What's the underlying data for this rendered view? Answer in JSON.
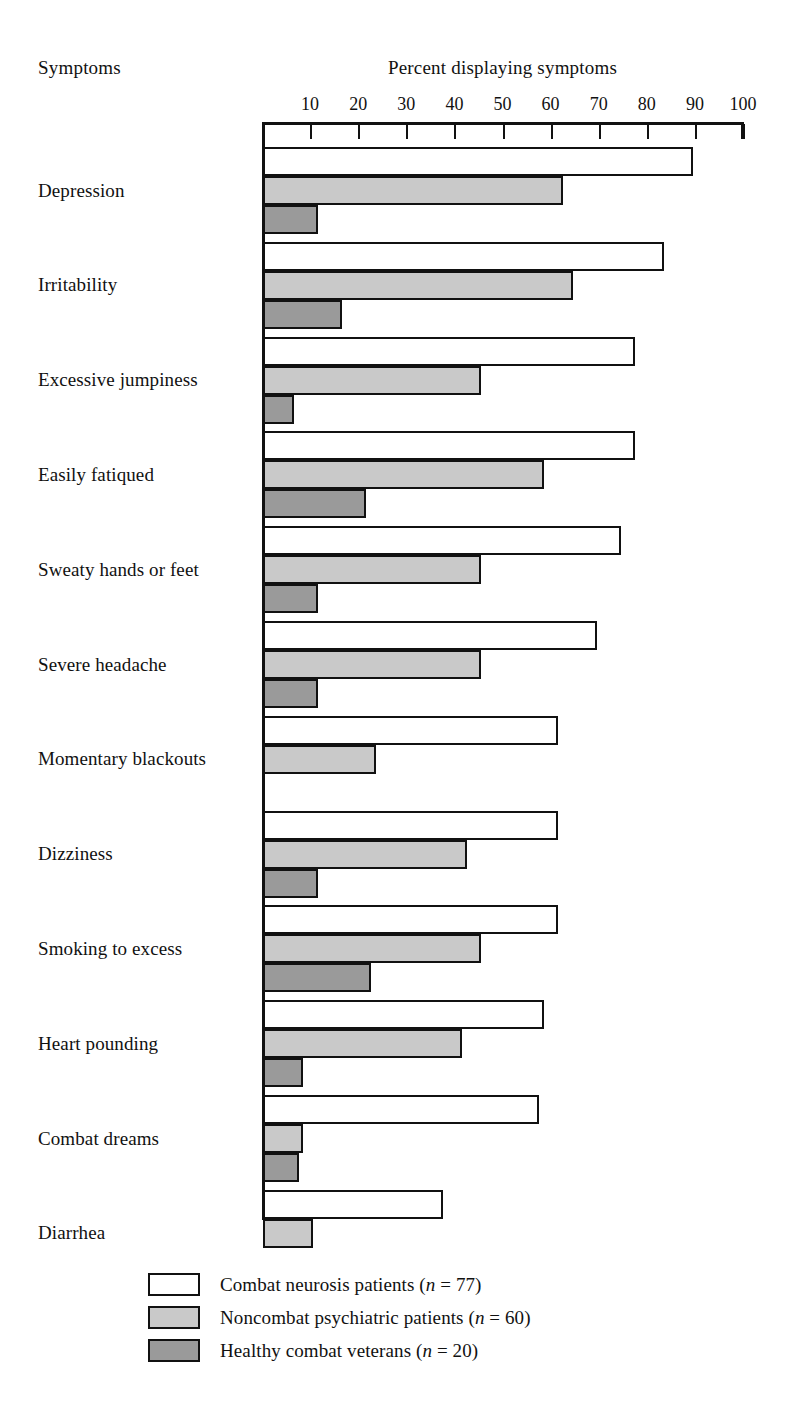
{
  "header": {
    "left_title": "Symptoms",
    "axis_title": "Percent displaying symptoms"
  },
  "chart_data": {
    "type": "bar",
    "orientation": "horizontal",
    "title": "Percent displaying symptoms",
    "xlabel": "Percent displaying symptoms",
    "ylabel": "Symptoms",
    "xlim": [
      0,
      100
    ],
    "xticks": [
      10,
      20,
      30,
      40,
      50,
      60,
      70,
      80,
      90,
      100
    ],
    "grid": false,
    "legend_position": "bottom",
    "categories": [
      "Depression",
      "Irritability",
      "Excessive jumpiness",
      "Easily fatiqued",
      "Sweaty hands or feet",
      "Severe headache",
      "Momentary blackouts",
      "Dizziness",
      "Smoking to excess",
      "Heart pounding",
      "Combat dreams",
      "Diarrhea"
    ],
    "series": [
      {
        "name": "Combat neurosis patients (n = 77)",
        "short_name": "Combat neurosis patients",
        "n": 77,
        "color": "#ffffff",
        "values": [
          89,
          83,
          77,
          77,
          74,
          69,
          61,
          61,
          61,
          58,
          57,
          37
        ]
      },
      {
        "name": "Noncombat psychiatric patients (n = 60)",
        "short_name": "Noncombat psychiatric patients",
        "n": 60,
        "color": "#c9c9c9",
        "values": [
          62,
          64,
          45,
          58,
          45,
          45,
          23,
          42,
          45,
          41,
          8,
          10
        ]
      },
      {
        "name": "Healthy combat veterans (n = 20)",
        "short_name": "Healthy combat veterans",
        "n": 20,
        "color": "#9a9a9a",
        "values": [
          11,
          16,
          6,
          21,
          11,
          11,
          0,
          11,
          22,
          8,
          7,
          0
        ]
      }
    ]
  },
  "legend": [
    {
      "label_main": "Combat neurosis patients (",
      "label_it": "n",
      "label_tail": " = 77)",
      "swatch": "white-swatch"
    },
    {
      "label_main": "Noncombat psychiatric patients (",
      "label_it": "n",
      "label_tail": " = 60)",
      "swatch": "light-gray-swatch"
    },
    {
      "label_main": "Healthy combat veterans (",
      "label_it": "n",
      "label_tail": " = 20)",
      "swatch": "dark-gray-swatch"
    }
  ],
  "colors": {
    "series_1": "#ffffff",
    "series_2": "#c9c9c9",
    "series_3": "#9a9a9a",
    "ink": "#111111",
    "background": "#ffffff"
  }
}
